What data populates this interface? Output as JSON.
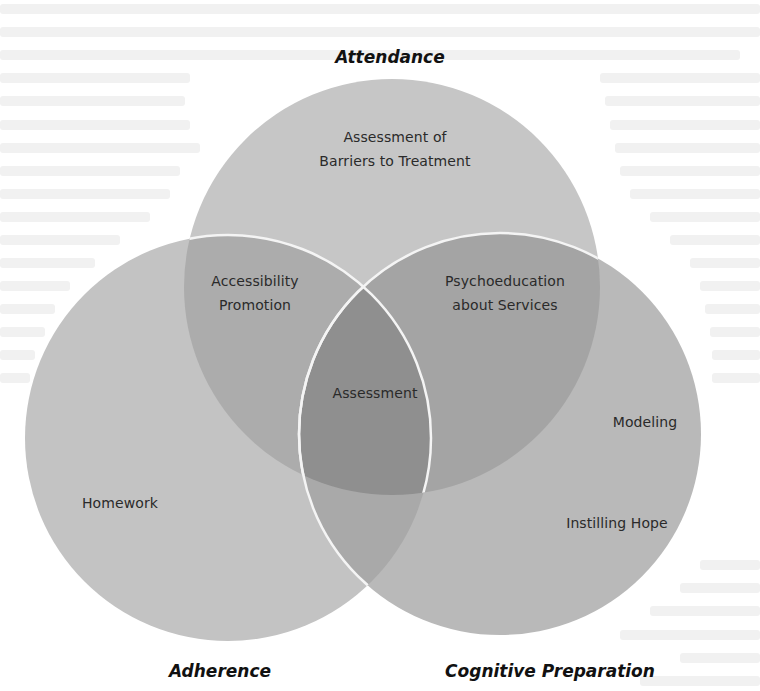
{
  "diagram": {
    "type": "venn",
    "sets": [
      {
        "id": "attendance",
        "title": "Attendance",
        "circle": {
          "cx": 392,
          "cy": 287,
          "r": 208
        }
      },
      {
        "id": "adherence",
        "title": "Adherence",
        "circle": {
          "cx": 228,
          "cy": 438,
          "r": 203
        }
      },
      {
        "id": "cognitive",
        "title": "Cognitive Preparation",
        "circle": {
          "cx": 500,
          "cy": 434,
          "r": 201
        }
      }
    ],
    "regions": {
      "attendance_only": [
        "Assessment of",
        "Barriers to Treatment"
      ],
      "attendance_adherence": [
        "Accessibility",
        "Promotion"
      ],
      "attendance_cognitive": [
        "Psychoeducation",
        "about Services"
      ],
      "all_three": [
        "Assessment"
      ],
      "adherence_only": [
        "Homework"
      ],
      "cognitive_only_1": [
        "Modeling"
      ],
      "cognitive_only_2": [
        "Instilling Hope"
      ]
    },
    "colors": {
      "background": "#ffffff",
      "single": "#c6c6c6",
      "double": "#a9a9a9",
      "triple": "#8f8f8f",
      "outline": "#f6f6f6",
      "text": "#2a2a2a",
      "title": "#111111"
    }
  }
}
